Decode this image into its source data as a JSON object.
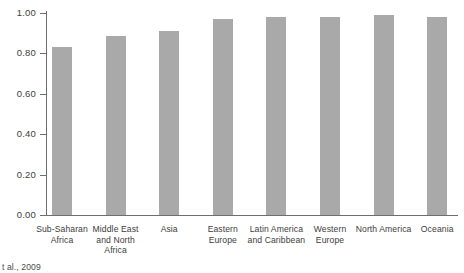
{
  "chart_data": {
    "type": "bar",
    "title": "",
    "xlabel": "",
    "ylabel": "",
    "ylim": [
      0.0,
      1.0
    ],
    "grid": false,
    "legend": null,
    "bar_color": "#a9a9a9",
    "axis_color": "#6e6e6e",
    "categories": [
      "Sub-Saharan Africa",
      "Middle East and North Africa",
      "Asia",
      "Eastern Europe",
      "Latin America and Caribbean",
      "Western Europe",
      "North America",
      "Oceania"
    ],
    "category_lines": [
      [
        "Sub-Saharan",
        "Africa"
      ],
      [
        "Middle East",
        "and North",
        "Africa"
      ],
      [
        "Asia"
      ],
      [
        "Eastern",
        "Europe"
      ],
      [
        "Latin America",
        "and Caribbean"
      ],
      [
        "Western",
        "Europe"
      ],
      [
        "North America"
      ],
      [
        "Oceania"
      ]
    ],
    "values": [
      0.83,
      0.885,
      0.91,
      0.97,
      0.98,
      0.98,
      0.99,
      0.98
    ],
    "ytick_labels": [
      "1.00",
      "0.80",
      "0.60",
      "0.40",
      "0.20",
      "0.00"
    ],
    "ytick_values": [
      1.0,
      0.8,
      0.6,
      0.4,
      0.2,
      0.0
    ]
  },
  "source_note": "t al., 2009"
}
